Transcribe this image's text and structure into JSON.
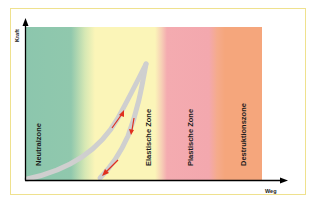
{
  "diagram": {
    "axes": {
      "y_label": "Kraft",
      "x_label": "Weg"
    },
    "zones": [
      {
        "label": "Neutralzone",
        "color": "#8cc6ad"
      },
      {
        "label": "Elastische Zone",
        "color": "#fbf5b8"
      },
      {
        "label": "Plastische Zone",
        "color": "#f4abb0"
      },
      {
        "label": "Destruktionszone",
        "color": "#f5a67c"
      }
    ],
    "curve": {
      "color": "#c8c8c8",
      "arrow_color": "#e0301e"
    },
    "frame_color": "#efe18e"
  }
}
